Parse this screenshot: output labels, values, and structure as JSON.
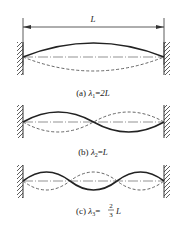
{
  "figure": {
    "dimension_label": "L",
    "panels": [
      {
        "id": "a",
        "caption_prefix": "(a) ",
        "lambda": "λ",
        "subscript": "1",
        "equals": "=",
        "value": "2L",
        "half_waves": 1
      },
      {
        "id": "b",
        "caption_prefix": "(b) ",
        "lambda": "λ",
        "subscript": "2",
        "equals": "=",
        "value": "L",
        "half_waves": 2
      },
      {
        "id": "c",
        "caption_prefix": "(c) ",
        "lambda": "λ",
        "subscript": "3",
        "equals": "=",
        "frac_num": "2",
        "frac_den": "3",
        "value": "L",
        "half_waves": 3
      }
    ],
    "colors": {
      "line": "#222222",
      "dashed": "#555555",
      "axis": "#666666"
    }
  }
}
